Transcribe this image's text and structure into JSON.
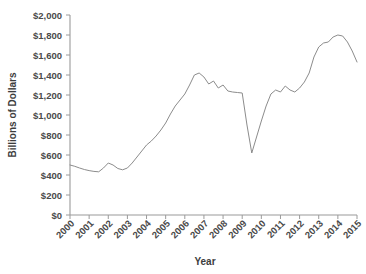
{
  "chart_data": {
    "type": "line",
    "title": "",
    "xlabel": "Year",
    "ylabel": "Billions of Dollars",
    "xlim": [
      2000,
      2015
    ],
    "ylim": [
      0,
      2000
    ],
    "grid": false,
    "legend": false,
    "line_color": "#8c8c8c",
    "axis_color": "#9a9a9a",
    "ytick_labels": [
      "$2,000",
      "$1,800",
      "$1,600",
      "$1,400",
      "$1,200",
      "$1,000",
      "$800",
      "$600",
      "$400",
      "$200",
      "$0"
    ],
    "ytick_values": [
      2000,
      1800,
      1600,
      1400,
      1200,
      1000,
      800,
      600,
      400,
      200,
      0
    ],
    "xtick_labels": [
      "2000",
      "2001",
      "2002",
      "2003",
      "2004",
      "2005",
      "2006",
      "2007",
      "2008",
      "2009",
      "2010",
      "2011",
      "2012",
      "2013",
      "2014",
      "2015"
    ],
    "xtick_values": [
      2000,
      2001,
      2002,
      2003,
      2004,
      2005,
      2006,
      2007,
      2008,
      2009,
      2010,
      2011,
      2012,
      2013,
      2014,
      2015
    ],
    "series": [
      {
        "name": "Value",
        "x": [
          2000.0,
          2000.25,
          2000.5,
          2000.75,
          2001.0,
          2001.25,
          2001.5,
          2001.75,
          2002.0,
          2002.25,
          2002.5,
          2002.75,
          2003.0,
          2003.25,
          2003.5,
          2003.75,
          2004.0,
          2004.25,
          2004.5,
          2004.75,
          2005.0,
          2005.25,
          2005.5,
          2005.75,
          2006.0,
          2006.25,
          2006.5,
          2006.75,
          2007.0,
          2007.25,
          2007.5,
          2007.75,
          2008.0,
          2008.25,
          2008.5,
          2008.75,
          2009.0,
          2009.25,
          2009.5,
          2009.75,
          2010.0,
          2010.25,
          2010.5,
          2010.75,
          2011.0,
          2011.25,
          2011.5,
          2011.75,
          2012.0,
          2012.25,
          2012.5,
          2012.75,
          2013.0,
          2013.25,
          2013.5,
          2013.75,
          2014.0,
          2014.25,
          2014.5,
          2014.75,
          2015.0
        ],
        "y": [
          500,
          487,
          470,
          455,
          444,
          436,
          432,
          470,
          520,
          500,
          465,
          452,
          470,
          520,
          580,
          640,
          700,
          740,
          790,
          850,
          920,
          1010,
          1090,
          1150,
          1210,
          1300,
          1400,
          1420,
          1380,
          1310,
          1340,
          1270,
          1300,
          1240,
          1230,
          1225,
          1220,
          900,
          620,
          780,
          940,
          1090,
          1210,
          1250,
          1230,
          1290,
          1250,
          1230,
          1270,
          1330,
          1420,
          1580,
          1680,
          1720,
          1730,
          1780,
          1800,
          1790,
          1730,
          1640,
          1530
        ]
      }
    ]
  }
}
